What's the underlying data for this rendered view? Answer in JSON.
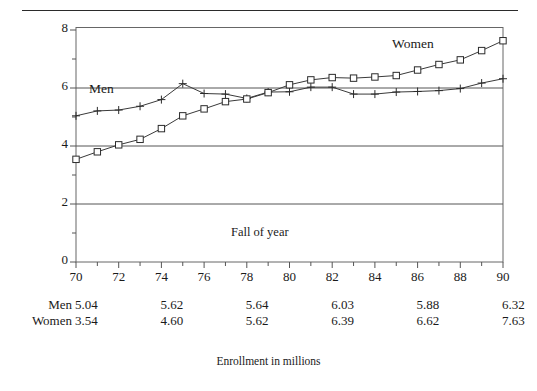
{
  "figure": {
    "caption": "Enrollment in millions",
    "inner_note": "Fall of year",
    "top_rule": true
  },
  "chart_data": {
    "type": "line",
    "title": "",
    "subtitle": "",
    "xlabel": "Fall of year",
    "ylabel": "",
    "caption": "Enrollment in millions",
    "grid": true,
    "legend_position": "inline-annotation",
    "xlim": [
      70,
      90
    ],
    "ylim": [
      0,
      8.1
    ],
    "yticks": [
      0,
      2,
      4,
      6,
      8
    ],
    "ytick_labels": [
      "0",
      "2",
      "4",
      "6",
      "8"
    ],
    "yminor_ticks": [
      1,
      3,
      5,
      7
    ],
    "xticks": [
      70,
      72,
      74,
      76,
      78,
      80,
      82,
      84,
      86,
      88,
      90
    ],
    "xtick_labels": [
      "70",
      "72",
      "74",
      "76",
      "78",
      "80",
      "82",
      "84",
      "86",
      "88",
      "90"
    ],
    "xminor_ticks": [
      71,
      73,
      75,
      77,
      79,
      81,
      83,
      85,
      87,
      89
    ],
    "x": [
      70,
      71,
      72,
      73,
      74,
      75,
      76,
      77,
      78,
      79,
      80,
      81,
      82,
      83,
      84,
      85,
      86,
      87,
      88,
      89,
      90
    ],
    "series": [
      {
        "name": "Men",
        "marker": "plus",
        "label_x": 75,
        "values": [
          5.04,
          5.21,
          5.24,
          5.37,
          5.6,
          6.15,
          5.81,
          5.79,
          5.64,
          5.86,
          5.87,
          6.03,
          6.03,
          5.79,
          5.79,
          5.86,
          5.88,
          5.91,
          5.98,
          6.17,
          6.32
        ]
      },
      {
        "name": "Women",
        "marker": "square",
        "label_x": 83,
        "values": [
          3.54,
          3.8,
          4.04,
          4.23,
          4.6,
          5.04,
          5.28,
          5.53,
          5.62,
          5.84,
          6.11,
          6.28,
          6.36,
          6.34,
          6.38,
          6.43,
          6.62,
          6.81,
          6.97,
          7.29,
          7.63
        ]
      }
    ]
  },
  "y_axis": {
    "ticks": [
      {
        "label": "8",
        "value": 8
      },
      {
        "label": "6",
        "value": 6
      },
      {
        "label": "4",
        "value": 4
      },
      {
        "label": "2",
        "value": 2
      },
      {
        "label": "0",
        "value": 0
      }
    ]
  },
  "x_axis": {
    "ticks": [
      {
        "label": "70",
        "value": 70
      },
      {
        "label": "72",
        "value": 72
      },
      {
        "label": "74",
        "value": 74
      },
      {
        "label": "76",
        "value": 76
      },
      {
        "label": "78",
        "value": 78
      },
      {
        "label": "80",
        "value": 80
      },
      {
        "label": "82",
        "value": 82
      },
      {
        "label": "84",
        "value": 84
      },
      {
        "label": "86",
        "value": 86
      },
      {
        "label": "88",
        "value": 88
      },
      {
        "label": "90",
        "value": 90
      }
    ]
  },
  "annotations": {
    "men": "Men",
    "women": "Women",
    "fall_of_year": "Fall of year"
  },
  "table": {
    "rows": [
      {
        "name": "Men",
        "values": [
          "5.04",
          "5.62",
          "5.64",
          "6.03",
          "5.88",
          "6.32"
        ]
      },
      {
        "name": "Women",
        "values": [
          "3.54",
          "4.60",
          "5.62",
          "6.39",
          "6.62",
          "7.63"
        ]
      }
    ],
    "value_years": [
      70,
      74,
      78,
      82,
      86,
      90
    ]
  },
  "colors": {
    "ink": "#1a1a1a",
    "line": "#3a3a3a",
    "grid": "#555555",
    "frame": "#555555",
    "background": "#ffffff"
  }
}
